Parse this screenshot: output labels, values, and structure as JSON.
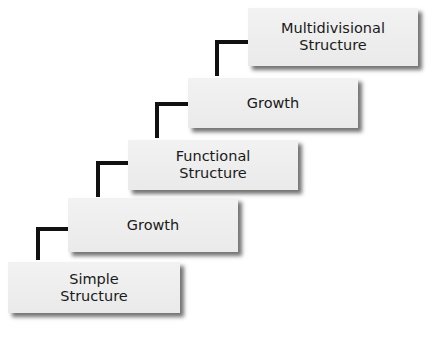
{
  "diagram": {
    "steps": [
      {
        "label": "Simple\nStructure"
      },
      {
        "label": "Growth"
      },
      {
        "label": "Functional\nStructure"
      },
      {
        "label": "Growth"
      },
      {
        "label": "Multidivisional\nStructure"
      }
    ]
  }
}
